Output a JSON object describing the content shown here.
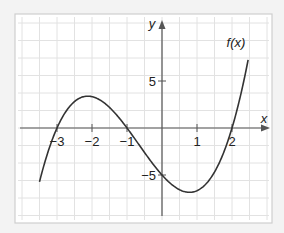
{
  "chart_data": {
    "type": "line",
    "title": "",
    "xlabel": "x",
    "ylabel": "y",
    "curve_label": "f(x)",
    "function": "f(x) = (5/6)(x+3)(x+1)(x-2)",
    "x_ticks": [
      -3,
      -2,
      -1,
      1,
      2
    ],
    "x_tick_labels": [
      "−3",
      "−2",
      "−1",
      "1",
      "2"
    ],
    "y_ticks": [
      5,
      -5
    ],
    "y_tick_labels": [
      "5",
      "−5"
    ],
    "xlim": [
      -4.0,
      3.2
    ],
    "ylim": [
      -10,
      12
    ],
    "grid": true,
    "roots": [
      -3,
      -1,
      2
    ],
    "y_intercept": -5,
    "local_max": {
      "x": -2.1,
      "y": 3.4
    },
    "local_min": {
      "x": 0.8,
      "y": -7.3
    },
    "series": [
      {
        "name": "f(x)",
        "x": [
          -3.5,
          -3.0,
          -2.5,
          -2.0,
          -1.5,
          -1.0,
          -0.5,
          0.0,
          0.5,
          1.0,
          1.5,
          2.0,
          2.5
        ],
        "y": [
          -6.6,
          0.0,
          3.1,
          3.3,
          1.9,
          0.0,
          -2.6,
          -5.0,
          -6.6,
          -6.7,
          -4.4,
          0.0,
          7.3
        ]
      }
    ]
  },
  "colors": {
    "background": "#f3f3f3",
    "frame_border": "#cfcfcf",
    "grid": "#e2e2e2",
    "axis": "#555555",
    "curve": "#333333"
  }
}
